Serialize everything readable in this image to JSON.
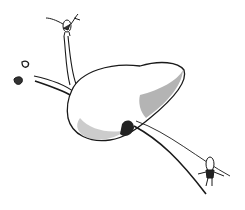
{
  "image": {
    "description": "Pen-and-ink sketch of a liver with ducts and small cartoon figures",
    "background": "#ffffff",
    "ink": "#1a1a1a"
  }
}
